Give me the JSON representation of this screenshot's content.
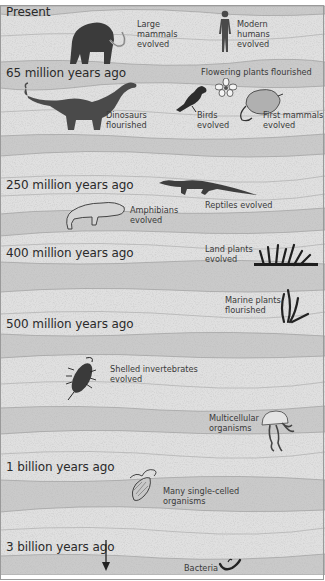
{
  "diagram": {
    "type": "geologic-strata-timeline",
    "colors": {
      "light_layer": "#e0e0e0",
      "dark_layer": "#cbcbcb",
      "boundary_line": "#9c9c9c",
      "text": "#2a2a2a",
      "silhouette": "#3b3b3b"
    },
    "time_markers": [
      {
        "label": "Present",
        "y": 12
      },
      {
        "label": "65 million years ago",
        "y": 72
      },
      {
        "label": "250 million years ago",
        "y": 185
      },
      {
        "label": "400 million years ago",
        "y": 253
      },
      {
        "label": "500 million years ago",
        "y": 324
      },
      {
        "label": "1 billion years ago",
        "y": 466
      },
      {
        "label": "3 billion years ago",
        "y": 541
      }
    ],
    "events": [
      {
        "id": "large-mammals",
        "text": "Large\nmammals\nevolved",
        "icon": "mammoth-icon"
      },
      {
        "id": "modern-humans",
        "text": "Modern\nhumans\nevolved",
        "icon": "human-icon"
      },
      {
        "id": "flowering-plants",
        "text": "Flowering plants flourished",
        "icon": "flower-icon"
      },
      {
        "id": "dinosaurs",
        "text": "Dinosaurs\nflourished",
        "icon": "dinosaur-icon"
      },
      {
        "id": "birds",
        "text": "Birds\nevolved",
        "icon": "bird-icon"
      },
      {
        "id": "first-mammals",
        "text": "First mammals\nevolved",
        "icon": "opossum-icon"
      },
      {
        "id": "reptiles",
        "text": "Reptiles evolved",
        "icon": "reptile-icon"
      },
      {
        "id": "amphibians",
        "text": "Amphibians\nevolved",
        "icon": "amphibian-icon"
      },
      {
        "id": "land-plants",
        "text": "Land plants\nevolved",
        "icon": "land-plant-icon"
      },
      {
        "id": "marine-plants",
        "text": "Marine plants\nflourished",
        "icon": "seaweed-icon"
      },
      {
        "id": "shelled-invertebrates",
        "text": "Shelled invertebrates\nevolved",
        "icon": "trilobite-icon"
      },
      {
        "id": "multicellular",
        "text": "Multicellular\norganisms",
        "icon": "jellyfish-icon"
      },
      {
        "id": "single-celled",
        "text": "Many single-celled\norganisms",
        "icon": "protist-icon"
      },
      {
        "id": "bacteria",
        "text": "Bacteria",
        "icon": "bacteria-icon"
      }
    ],
    "arrow": {
      "direction": "down",
      "meaning": "older-time-continues"
    }
  }
}
